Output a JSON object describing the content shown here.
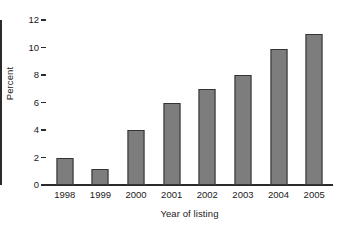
{
  "chart_data": {
    "type": "bar",
    "title": "",
    "subtitle": "",
    "xlabel": "Year of listing",
    "ylabel": "Percent",
    "categories": [
      "1998",
      "1999",
      "2000",
      "2001",
      "2002",
      "2003",
      "2004",
      "2005"
    ],
    "values": [
      2,
      1.2,
      4,
      6,
      7,
      8,
      9.9,
      11
    ],
    "series": [
      {
        "name": "Percent",
        "values": [
          2,
          1.2,
          4,
          6,
          7,
          8,
          9.9,
          11
        ]
      }
    ],
    "ylim": [
      0,
      12
    ],
    "ytick_labels": [
      "0",
      "2",
      "4",
      "6",
      "8",
      "10",
      "12"
    ],
    "ytick_values": [
      0,
      2,
      4,
      6,
      8,
      10,
      12
    ],
    "grid": false,
    "legend": false,
    "legend_position": "none",
    "bar_fill_color": "#7d7d7d",
    "bar_border_color": "#333333",
    "axis_color": "#2b2b2b",
    "background_color": "#ffffff"
  }
}
